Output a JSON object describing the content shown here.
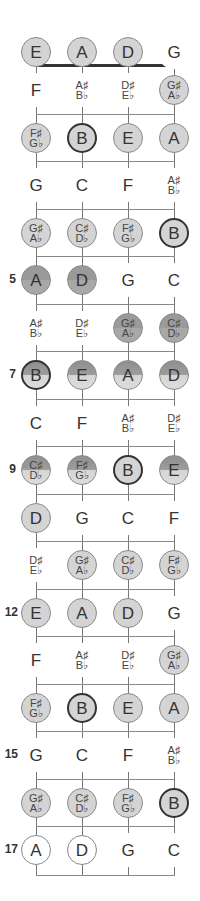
{
  "diagram": {
    "type": "bass-fretboard",
    "strings": [
      "E",
      "A",
      "D",
      "G"
    ],
    "colors": {
      "highlight_fill": "#d4d4d4",
      "dark_fill": "#9a9a9a",
      "root_border": "#333333",
      "line": "#888888",
      "nut": "#333333"
    },
    "fret_labels": [
      {
        "fret": 5,
        "label": "5"
      },
      {
        "fret": 7,
        "label": "7"
      },
      {
        "fret": 9,
        "label": "9"
      },
      {
        "fret": 12,
        "label": "12"
      },
      {
        "fret": 15,
        "label": "15"
      },
      {
        "fret": 17,
        "label": "17"
      }
    ],
    "rows": [
      {
        "fret": 0,
        "notes": [
          {
            "l1": "E",
            "style": "circ"
          },
          {
            "l1": "A",
            "style": "circ"
          },
          {
            "l1": "D",
            "style": "circ"
          },
          {
            "l1": "G",
            "style": "plain"
          }
        ]
      },
      {
        "fret": 1,
        "notes": [
          {
            "l1": "F",
            "style": "plain"
          },
          {
            "l1": "A♯",
            "l2": "B♭",
            "style": "plain"
          },
          {
            "l1": "D♯",
            "l2": "E♭",
            "style": "plain"
          },
          {
            "l1": "G♯",
            "l2": "A♭",
            "style": "circ"
          }
        ]
      },
      {
        "fret": 2,
        "notes": [
          {
            "l1": "F♯",
            "l2": "G♭",
            "style": "circ"
          },
          {
            "l1": "B",
            "style": "circ root"
          },
          {
            "l1": "E",
            "style": "circ"
          },
          {
            "l1": "A",
            "style": "circ"
          }
        ]
      },
      {
        "fret": 3,
        "notes": [
          {
            "l1": "G",
            "style": "plain"
          },
          {
            "l1": "C",
            "style": "plain"
          },
          {
            "l1": "F",
            "style": "plain"
          },
          {
            "l1": "A♯",
            "l2": "B♭",
            "style": "plain"
          }
        ]
      },
      {
        "fret": 4,
        "notes": [
          {
            "l1": "G♯",
            "l2": "A♭",
            "style": "circ"
          },
          {
            "l1": "C♯",
            "l2": "D♭",
            "style": "circ"
          },
          {
            "l1": "F♯",
            "l2": "G♭",
            "style": "circ"
          },
          {
            "l1": "B",
            "style": "circ root"
          }
        ]
      },
      {
        "fret": 5,
        "notes": [
          {
            "l1": "A",
            "style": "circ dark"
          },
          {
            "l1": "D",
            "style": "circ dark"
          },
          {
            "l1": "G",
            "style": "plain"
          },
          {
            "l1": "C",
            "style": "plain"
          }
        ]
      },
      {
        "fret": 6,
        "notes": [
          {
            "l1": "A♯",
            "l2": "B♭",
            "style": "plain"
          },
          {
            "l1": "D♯",
            "l2": "E♭",
            "style": "plain"
          },
          {
            "l1": "G♯",
            "l2": "A♭",
            "style": "circ dark"
          },
          {
            "l1": "C♯",
            "l2": "D♭",
            "style": "circ dark"
          }
        ]
      },
      {
        "fret": 7,
        "notes": [
          {
            "l1": "B",
            "style": "circ half root"
          },
          {
            "l1": "E",
            "style": "circ half"
          },
          {
            "l1": "A",
            "style": "circ half"
          },
          {
            "l1": "D",
            "style": "circ half"
          }
        ]
      },
      {
        "fret": 8,
        "notes": [
          {
            "l1": "C",
            "style": "plain"
          },
          {
            "l1": "F",
            "style": "plain"
          },
          {
            "l1": "A♯",
            "l2": "B♭",
            "style": "plain"
          },
          {
            "l1": "D♯",
            "l2": "E♭",
            "style": "plain"
          }
        ]
      },
      {
        "fret": 9,
        "notes": [
          {
            "l1": "C♯",
            "l2": "D♭",
            "style": "circ half"
          },
          {
            "l1": "F♯",
            "l2": "G♭",
            "style": "circ half"
          },
          {
            "l1": "B",
            "style": "circ root"
          },
          {
            "l1": "E",
            "style": "circ half"
          }
        ]
      },
      {
        "fret": 10,
        "notes": [
          {
            "l1": "D",
            "style": "circ"
          },
          {
            "l1": "G",
            "style": "plain"
          },
          {
            "l1": "C",
            "style": "plain"
          },
          {
            "l1": "F",
            "style": "plain"
          }
        ]
      },
      {
        "fret": 11,
        "notes": [
          {
            "l1": "D♯",
            "l2": "E♭",
            "style": "plain"
          },
          {
            "l1": "G♯",
            "l2": "A♭",
            "style": "circ"
          },
          {
            "l1": "C♯",
            "l2": "D♭",
            "style": "circ"
          },
          {
            "l1": "F♯",
            "l2": "G♭",
            "style": "circ"
          }
        ]
      },
      {
        "fret": 12,
        "notes": [
          {
            "l1": "E",
            "style": "circ"
          },
          {
            "l1": "A",
            "style": "circ"
          },
          {
            "l1": "D",
            "style": "circ"
          },
          {
            "l1": "G",
            "style": "plain"
          }
        ]
      },
      {
        "fret": 13,
        "notes": [
          {
            "l1": "F",
            "style": "plain"
          },
          {
            "l1": "A♯",
            "l2": "B♭",
            "style": "plain"
          },
          {
            "l1": "D♯",
            "l2": "E♭",
            "style": "plain"
          },
          {
            "l1": "G♯",
            "l2": "A♭",
            "style": "circ"
          }
        ]
      },
      {
        "fret": 14,
        "notes": [
          {
            "l1": "F♯",
            "l2": "G♭",
            "style": "circ"
          },
          {
            "l1": "B",
            "style": "circ root"
          },
          {
            "l1": "E",
            "style": "circ"
          },
          {
            "l1": "A",
            "style": "circ"
          }
        ]
      },
      {
        "fret": 15,
        "notes": [
          {
            "l1": "G",
            "style": "plain"
          },
          {
            "l1": "C",
            "style": "plain"
          },
          {
            "l1": "F",
            "style": "plain"
          },
          {
            "l1": "A♯",
            "l2": "B♭",
            "style": "plain"
          }
        ]
      },
      {
        "fret": 16,
        "notes": [
          {
            "l1": "G♯",
            "l2": "A♭",
            "style": "circ"
          },
          {
            "l1": "C♯",
            "l2": "D♭",
            "style": "circ"
          },
          {
            "l1": "F♯",
            "l2": "G♭",
            "style": "circ"
          },
          {
            "l1": "B",
            "style": "circ root"
          }
        ]
      },
      {
        "fret": 17,
        "notes": [
          {
            "l1": "A",
            "style": "circ open"
          },
          {
            "l1": "D",
            "style": "circ open"
          },
          {
            "l1": "G",
            "style": "plain"
          },
          {
            "l1": "C",
            "style": "plain"
          }
        ]
      }
    ]
  }
}
